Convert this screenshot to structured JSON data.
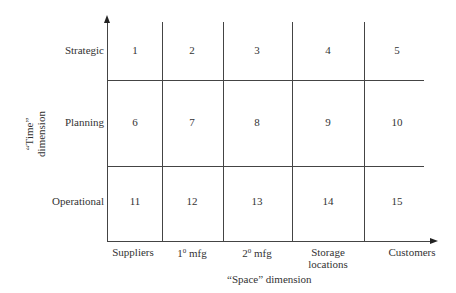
{
  "diagram": {
    "y_axis_title_line1": "“Time”",
    "y_axis_title_line2": "dimension",
    "x_axis_title": "“Space” dimension",
    "rows": [
      {
        "label": "Strategic",
        "cells": [
          "1",
          "2",
          "3",
          "4",
          "5"
        ]
      },
      {
        "label": "Planning",
        "cells": [
          "6",
          "7",
          "8",
          "9",
          "10"
        ]
      },
      {
        "label": "Operational",
        "cells": [
          "11",
          "12",
          "13",
          "14",
          "15"
        ]
      }
    ],
    "columns": [
      {
        "label": "Suppliers"
      },
      {
        "label_base": "1",
        "label_sup": "0",
        "label_rest": " mfg"
      },
      {
        "label_base": "2",
        "label_sup": "0",
        "label_rest": " mfg"
      },
      {
        "label_line1": "Storage",
        "label_line2": "locations"
      },
      {
        "label": "Customers"
      }
    ],
    "colors": {
      "line": "#444444",
      "text": "#333333",
      "background": "#ffffff"
    }
  }
}
